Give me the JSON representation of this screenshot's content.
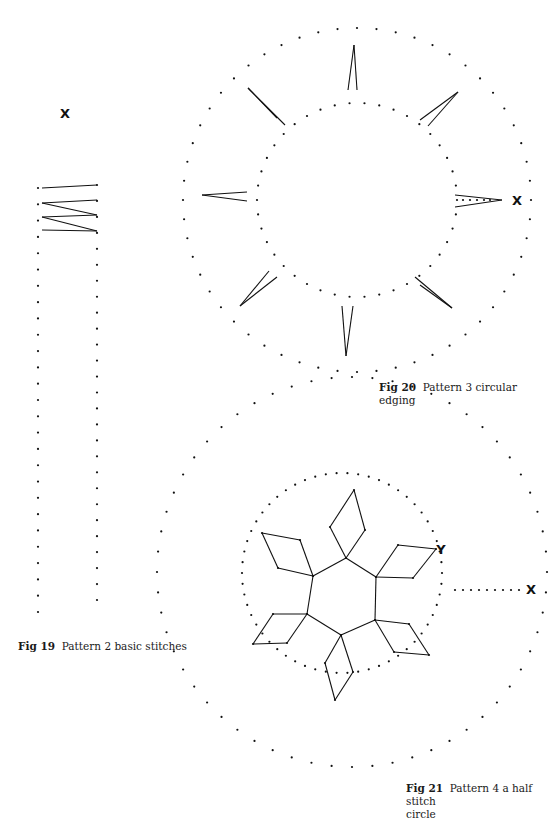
{
  "page": {
    "background": "#ffffff",
    "ink": "#111111"
  },
  "captions": {
    "fig19": {
      "label": "Fig 19",
      "text": "Pattern 2 basic stitches"
    },
    "fig20": {
      "label": "Fig 20",
      "text": "Pattern 3 circular",
      "text2": "edging"
    },
    "fig21": {
      "label": "Fig 21",
      "text": "Pattern 4 a half stitch",
      "text2": "circle"
    }
  },
  "fig19": {
    "markers": [
      {
        "label": "X",
        "x": 65,
        "y": 118
      }
    ],
    "columns": [
      {
        "x": 38,
        "y_start": 188,
        "y_end": 612,
        "count": 27
      },
      {
        "x": 97,
        "y_start": 185,
        "y_end": 600,
        "count": 27
      }
    ],
    "stitches": [
      [
        42,
        188,
        97,
        185
      ],
      [
        42,
        203,
        97,
        200
      ],
      [
        42,
        203,
        97,
        215
      ],
      [
        42,
        217,
        97,
        215
      ],
      [
        42,
        217,
        97,
        231
      ],
      [
        42,
        230,
        97,
        231
      ]
    ]
  },
  "fig20": {
    "markers": [
      {
        "label": "X",
        "x": 517,
        "y": 205
      }
    ],
    "rings": [
      {
        "cx": 357,
        "cy": 200,
        "rx": 174,
        "ry": 172,
        "count": 56
      },
      {
        "cx": 357,
        "cy": 200,
        "rx": 100,
        "ry": 97,
        "count": 42
      }
    ],
    "extra_dots": [
      [
        463,
        200
      ],
      [
        470,
        200
      ],
      [
        477,
        200
      ],
      [
        484,
        200
      ],
      [
        490,
        200
      ]
    ],
    "spikes": [
      [
        348,
        90,
        354,
        45
      ],
      [
        357,
        90,
        354,
        45
      ],
      [
        277,
        118,
        248,
        88
      ],
      [
        285,
        125,
        248,
        88
      ],
      [
        420,
        120,
        458,
        92
      ],
      [
        428,
        126,
        458,
        92
      ],
      [
        247,
        192,
        202,
        195
      ],
      [
        247,
        201,
        202,
        195
      ],
      [
        455,
        195,
        502,
        200
      ],
      [
        455,
        207,
        502,
        200
      ],
      [
        269,
        271,
        240,
        306
      ],
      [
        277,
        277,
        240,
        306
      ],
      [
        415,
        277,
        452,
        308
      ],
      [
        420,
        285,
        452,
        308
      ],
      {
        "note": "placeholder"
      },
      [
        342,
        306,
        346,
        356
      ],
      [
        353,
        306,
        346,
        356
      ]
    ]
  },
  "fig21": {
    "markers": [
      {
        "label": "Y",
        "x": 441,
        "y": 554
      },
      {
        "label": "X",
        "x": 531,
        "y": 594
      }
    ],
    "rings": [
      {
        "cx": 352,
        "cy": 572,
        "rx": 195,
        "ry": 195,
        "count": 60
      },
      {
        "cx": 342,
        "cy": 573,
        "rx": 100,
        "ry": 100,
        "count": 58
      }
    ],
    "extra_dots": [
      [
        455,
        590
      ],
      [
        463,
        590
      ],
      [
        471,
        590
      ],
      [
        479,
        590
      ],
      [
        487,
        590
      ],
      [
        495,
        590
      ],
      [
        503,
        590
      ],
      [
        511,
        590
      ],
      [
        519,
        590
      ]
    ],
    "hexagon": [
      [
        346,
        558
      ],
      [
        376,
        577
      ],
      [
        375,
        620
      ],
      [
        341,
        635
      ],
      [
        307,
        614
      ],
      [
        313,
        576
      ]
    ],
    "petals": [
      [
        [
          346,
          558
        ],
        [
          330,
          527
        ],
        [
          354,
          490
        ],
        [
          365,
          530
        ]
      ],
      [
        [
          376,
          577
        ],
        [
          398,
          545
        ],
        [
          436,
          549
        ],
        [
          413,
          578
        ]
      ],
      [
        [
          375,
          620
        ],
        [
          409,
          624
        ],
        [
          429,
          655
        ],
        [
          394,
          652
        ]
      ],
      [
        [
          341,
          635
        ],
        [
          353,
          672
        ],
        [
          335,
          700
        ],
        [
          325,
          663
        ]
      ],
      [
        [
          307,
          614
        ],
        [
          287,
          643
        ],
        [
          253,
          644
        ],
        [
          273,
          614
        ]
      ],
      [
        [
          313,
          576
        ],
        [
          278,
          568
        ],
        [
          262,
          533
        ],
        [
          300,
          540
        ]
      ]
    ]
  }
}
